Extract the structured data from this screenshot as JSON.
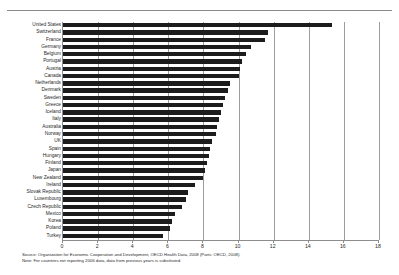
{
  "page": {
    "clipped_title": "",
    "notes": [
      "Source: Organization for Economic Cooperation and Development, OECD Health Data, 2008 (Paris: OECD, 2008).",
      "Note: For countries not reporting 2006 data, data from previous years is substituted."
    ]
  },
  "chart_data": {
    "type": "bar",
    "orientation": "horizontal",
    "title": "",
    "xlabel": "",
    "ylabel": "",
    "xlim": [
      0,
      18
    ],
    "ticks": [
      0,
      2,
      4,
      6,
      8,
      10,
      12,
      14,
      16,
      18
    ],
    "grid": true,
    "legend": "none",
    "bar_color": "#1c1c1c",
    "categories": [
      "United States",
      "Switzerland",
      "France",
      "Germany",
      "Belgium",
      "Portugal",
      "Austria",
      "Canada",
      "Netherlands",
      "Denmark",
      "Sweden",
      "Greece",
      "Iceland",
      "Italy",
      "Australia",
      "Norway",
      "UK",
      "Spain",
      "Hungary",
      "Finland",
      "Japan",
      "New Zealand",
      "Ireland",
      "Slovak Republic",
      "Luxembourg",
      "Czech Republic",
      "Mexico",
      "Korea",
      "Poland",
      "Turkey"
    ],
    "values": [
      15.3,
      11.7,
      11.5,
      10.7,
      10.4,
      10.2,
      10.1,
      10.0,
      9.5,
      9.4,
      9.2,
      9.1,
      9.0,
      8.9,
      8.8,
      8.7,
      8.5,
      8.4,
      8.3,
      8.2,
      8.1,
      8.0,
      7.5,
      7.1,
      7.0,
      6.8,
      6.4,
      6.2,
      6.1,
      5.7
    ]
  }
}
